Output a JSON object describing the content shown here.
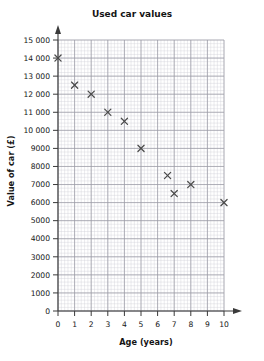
{
  "chart_data": {
    "type": "scatter",
    "title": "Used car values",
    "xlabel": "Age (years)",
    "ylabel": "Value of car (£)",
    "xlim": [
      0,
      10
    ],
    "ylim": [
      0,
      15000
    ],
    "grid": true,
    "legend": null,
    "x_tick_labels": [
      "0",
      "1",
      "2",
      "3",
      "4",
      "5",
      "6",
      "7",
      "8",
      "9",
      "10"
    ],
    "y_tick_labels": [
      "0",
      "1000",
      "2000",
      "3000",
      "4000",
      "5000",
      "6000",
      "7000",
      "8000",
      "9000",
      "10 000",
      "11 000",
      "12 000",
      "13 000",
      "14 000",
      "15 000"
    ],
    "x_ticks": [
      0,
      1,
      2,
      3,
      4,
      5,
      6,
      7,
      8,
      9,
      10
    ],
    "y_ticks": [
      0,
      1000,
      2000,
      3000,
      4000,
      5000,
      6000,
      7000,
      8000,
      9000,
      10000,
      11000,
      12000,
      13000,
      14000,
      15000
    ],
    "x_minor_step": 0.2,
    "y_minor_step": 200,
    "marker": "x",
    "marker_color": "#4a4a4a",
    "x": [
      0,
      1,
      2,
      3,
      4,
      5,
      6.6,
      7,
      8,
      10
    ],
    "y": [
      14000,
      12500,
      12000,
      11000,
      10500,
      9000,
      7500,
      6500,
      7000,
      6000
    ],
    "points": [
      {
        "age": 0,
        "value": 14000
      },
      {
        "age": 1,
        "value": 12500
      },
      {
        "age": 2,
        "value": 12000
      },
      {
        "age": 3,
        "value": 11000
      },
      {
        "age": 4,
        "value": 10500
      },
      {
        "age": 5,
        "value": 9000
      },
      {
        "age": 6.6,
        "value": 7500
      },
      {
        "age": 7,
        "value": 6500
      },
      {
        "age": 8,
        "value": 7000
      },
      {
        "age": 10,
        "value": 6000
      }
    ]
  },
  "colors": {
    "background": "#ffffff",
    "axis": "#3a3a3a",
    "grid_minor": "#cfcfd6",
    "grid_major": "#9b9ba6",
    "marker": "#4a4a4a",
    "text": "#141414"
  }
}
